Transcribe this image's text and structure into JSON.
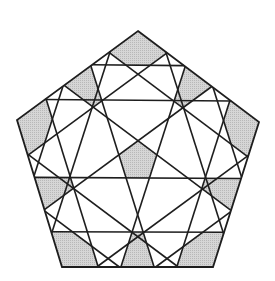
{
  "figure": {
    "width": 275,
    "height": 281,
    "colors": {
      "background": "#ffffff",
      "line": "#1e1e1e",
      "shade": "#d6d6d6",
      "shade_dot": "#b8b8b8"
    },
    "stroke_width": 1.6,
    "outline_stroke_width": 1.8,
    "pentagon": {
      "vertices": [
        [
          138,
          31
        ],
        [
          259,
          122
        ],
        [
          213,
          267
        ],
        [
          62,
          267
        ],
        [
          17,
          120
        ]
      ]
    },
    "chords": {
      "near_params": [
        0.61,
        0.24
      ],
      "far_params": [
        0.38,
        0.77
      ],
      "count": 20
    },
    "shaded_regions": {
      "corners": 5,
      "mid_edges": 5,
      "center": 1
    }
  }
}
